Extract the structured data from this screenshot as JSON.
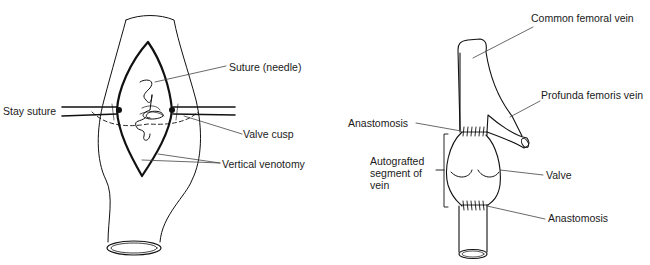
{
  "left_figure": {
    "labels": {
      "suture_needle": "Suture (needle)",
      "stay_suture": "Stay suture",
      "valve_cusp": "Valve cusp",
      "vertical_venotomy": "Vertical venotomy"
    }
  },
  "right_figure": {
    "labels": {
      "common_femoral_vein": "Common femoral vein",
      "profunda_femoris_vein": "Profunda femoris vein",
      "anastomosis_top": "Anastomosis",
      "autografted_segment": "Autografted\nsegment of\nvein",
      "valve": "Valve",
      "anastomosis_bottom": "Anastomosis"
    }
  },
  "colors": {
    "stroke": "#111111",
    "leader": "#444444",
    "text": "#1a1a1a"
  }
}
